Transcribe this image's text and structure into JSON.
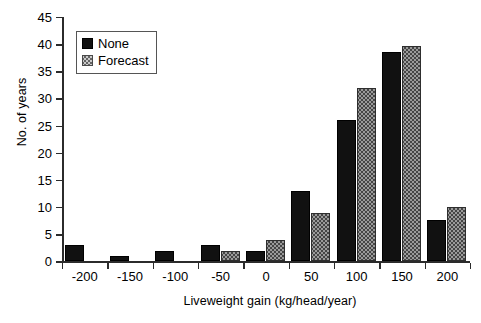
{
  "chart_data": {
    "type": "bar",
    "title": "",
    "xlabel": "Liveweight gain (kg/head/year)",
    "ylabel": "No. of years",
    "categories": [
      "-200",
      "-150",
      "-100",
      "-50",
      "0",
      "50",
      "100",
      "150",
      "200"
    ],
    "series": [
      {
        "name": "None",
        "values": [
          3,
          1,
          2,
          3,
          2,
          13,
          26,
          38.6,
          7.6
        ]
      },
      {
        "name": "Forecast",
        "values": [
          0,
          0,
          0,
          2,
          4,
          9,
          32,
          39.7,
          10
        ]
      }
    ],
    "ylim": [
      0,
      45
    ],
    "yticks": [
      0,
      5,
      10,
      15,
      20,
      25,
      30,
      35,
      40,
      45
    ],
    "ytick_labels": [
      "0",
      "5",
      "10",
      "15",
      "20",
      "25",
      "30",
      "35",
      "40",
      "45"
    ],
    "grid": false,
    "legend_position": "top-left",
    "legend_entries": [
      {
        "label": "None",
        "pattern": "solid-black",
        "color": "#111111"
      },
      {
        "label": "Forecast",
        "pattern": "crosshatch",
        "color": "#9a9a9a"
      }
    ]
  }
}
